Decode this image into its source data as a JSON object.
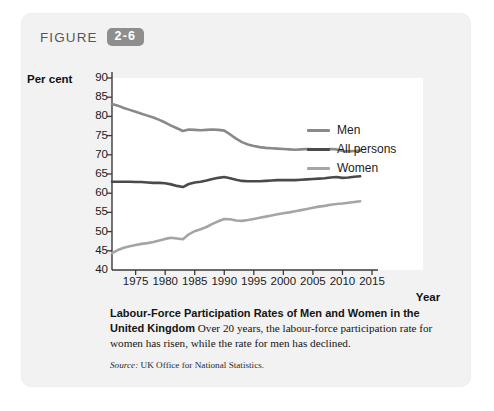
{
  "figure": {
    "label": "FIGURE",
    "number": "2-6"
  },
  "caption": {
    "title": "Labour-Force Participation Rates of Men and Women in the United Kingdom",
    "body": " Over 20 years, the labour-force participation rate for women has risen, while the rate for men has declined.",
    "source_label": "Source:",
    "source_text": " UK Office for National Statistics."
  },
  "colors": {
    "panel_background": "#f2f2f2",
    "plot_background": "#ffffff",
    "badge": "#8e8e8e",
    "axis": "#3a3a3a",
    "men": "#898989",
    "all_persons": "#4a4a4a",
    "women": "#a5a5a5"
  },
  "chart_data": {
    "type": "line",
    "title": "Labour-Force Participation Rates of Men and Women in the United Kingdom",
    "xlabel": "Year",
    "ylabel": "Per cent",
    "xlim": [
      1971,
      2015
    ],
    "ylim": [
      40,
      90
    ],
    "xticks": [
      1975,
      1980,
      1985,
      1990,
      1995,
      2000,
      2005,
      2010,
      2015
    ],
    "yticks": [
      40,
      45,
      50,
      55,
      60,
      65,
      70,
      75,
      80,
      85,
      90
    ],
    "grid": false,
    "legend_position": "top-right",
    "x": [
      1971,
      1972,
      1973,
      1974,
      1975,
      1976,
      1977,
      1978,
      1979,
      1980,
      1981,
      1982,
      1983,
      1984,
      1985,
      1986,
      1987,
      1988,
      1989,
      1990,
      1991,
      1992,
      1993,
      1994,
      1995,
      1996,
      1997,
      1998,
      1999,
      2000,
      2001,
      2002,
      2003,
      2004,
      2005,
      2006,
      2007,
      2008,
      2009,
      2010,
      2011,
      2012,
      2013
    ],
    "series": [
      {
        "name": "Men",
        "color": "#898989",
        "values": [
          83.2,
          82.8,
          82.2,
          81.7,
          81.2,
          80.7,
          80.2,
          79.7,
          79.1,
          78.4,
          77.6,
          76.9,
          76.2,
          76.6,
          76.5,
          76.4,
          76.5,
          76.6,
          76.5,
          76.3,
          75.3,
          74.2,
          73.3,
          72.7,
          72.3,
          72.0,
          71.8,
          71.7,
          71.6,
          71.5,
          71.4,
          71.3,
          71.4,
          71.5,
          71.4,
          71.3,
          71.3,
          71.5,
          71.4,
          71.0,
          70.9,
          71.0,
          71.1
        ]
      },
      {
        "name": "All persons",
        "color": "#4a4a4a",
        "values": [
          63.0,
          63.0,
          63.0,
          63.0,
          62.9,
          62.9,
          62.8,
          62.7,
          62.7,
          62.6,
          62.3,
          61.9,
          61.6,
          62.4,
          62.8,
          63.0,
          63.3,
          63.7,
          64.0,
          64.2,
          63.9,
          63.5,
          63.2,
          63.1,
          63.1,
          63.1,
          63.2,
          63.3,
          63.4,
          63.4,
          63.4,
          63.4,
          63.5,
          63.6,
          63.7,
          63.8,
          63.9,
          64.1,
          64.2,
          64.0,
          64.1,
          64.3,
          64.4
        ]
      },
      {
        "name": "Women",
        "color": "#a5a5a5",
        "values": [
          44.4,
          45.2,
          45.8,
          46.2,
          46.5,
          46.8,
          47.0,
          47.3,
          47.7,
          48.1,
          48.4,
          48.2,
          48.0,
          49.3,
          50.1,
          50.6,
          51.2,
          52.0,
          52.7,
          53.3,
          53.2,
          52.9,
          52.8,
          53.0,
          53.3,
          53.6,
          53.9,
          54.2,
          54.5,
          54.8,
          55.0,
          55.3,
          55.6,
          55.9,
          56.2,
          56.5,
          56.7,
          57.0,
          57.2,
          57.3,
          57.5,
          57.7,
          57.9
        ]
      }
    ]
  }
}
